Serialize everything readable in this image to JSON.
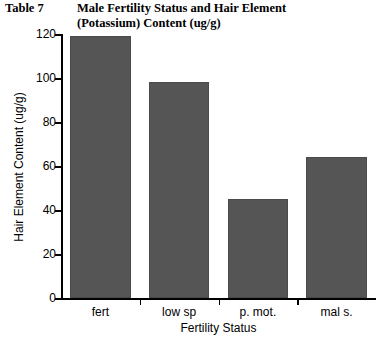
{
  "table_label": "Table 7",
  "title_lines": [
    "Male Fertility Status and Hair Element",
    "(Potassium) Content (ug/g)"
  ],
  "colors": {
    "bar_fill": "#555555",
    "bar_edge": "#4a4a4a",
    "axis": "#000000",
    "text": "#000000",
    "background": "#ffffff"
  },
  "chart_data": {
    "type": "bar",
    "title": "Male Fertility Status and Hair Element (Potassium) Content (ug/g)",
    "xlabel": "Fertility Status",
    "ylabel": "Hair Element Content (ug/g)",
    "categories": [
      "fert",
      "low sp",
      "p. mot.",
      "mal s."
    ],
    "values": [
      119,
      98,
      45,
      64
    ],
    "ylim": [
      0,
      120
    ],
    "yticks": [
      0,
      20,
      40,
      60,
      80,
      100,
      120
    ],
    "ytick_labels": [
      "0",
      "20",
      "40",
      "60",
      "80",
      "100",
      "120"
    ],
    "grid": false,
    "legend": false
  }
}
